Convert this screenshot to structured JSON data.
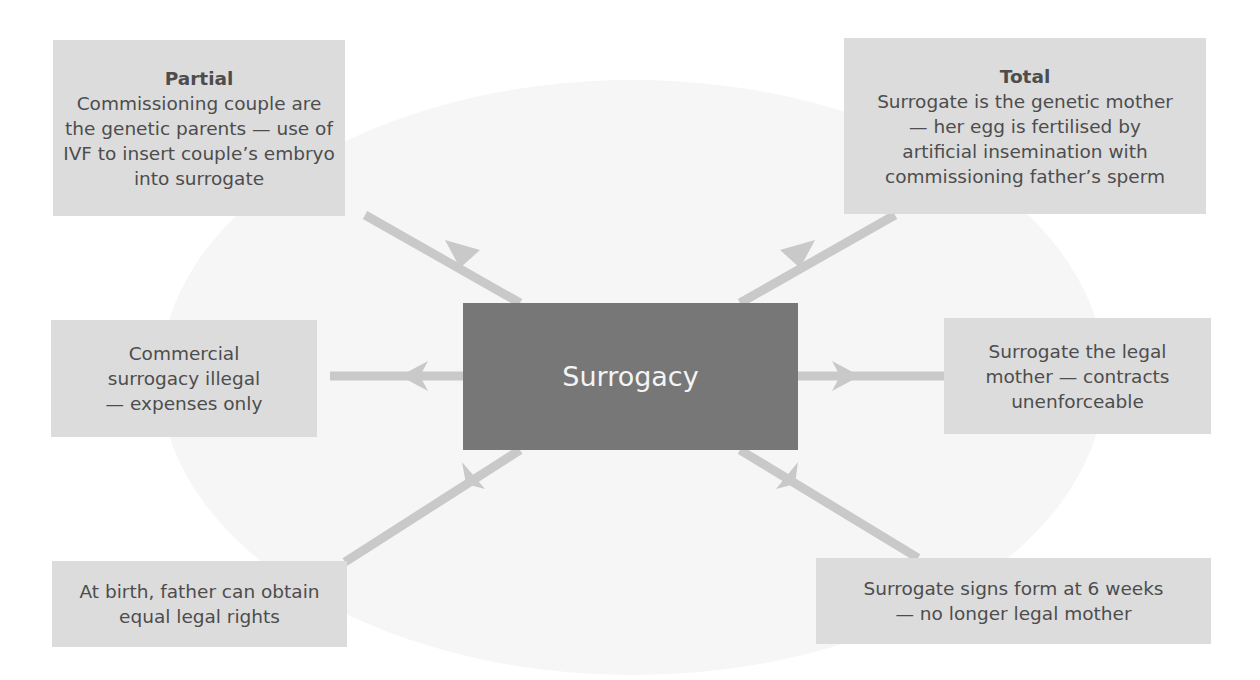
{
  "center": {
    "label": "Surrogacy"
  },
  "nodes": {
    "top_left": {
      "title": "Partial",
      "lines": [
        "Commissioning couple are",
        "the genetic parents — use of",
        "IVF to insert couple’s embryo",
        "into surrogate"
      ]
    },
    "top_right": {
      "title": "Total",
      "lines": [
        "Surrogate is the genetic mother",
        "— her egg is fertilised by",
        "artificial insemination with",
        "commissioning father’s sperm"
      ]
    },
    "mid_left": {
      "lines": [
        "Commercial",
        "surrogacy illegal",
        "— expenses only"
      ]
    },
    "mid_right": {
      "lines": [
        "Surrogate the legal",
        "mother — contracts",
        "unenforceable"
      ]
    },
    "bottom_left": {
      "lines": [
        "At birth, father can obtain",
        "equal legal rights"
      ]
    },
    "bottom_right": {
      "lines": [
        "Surrogate signs form at 6 weeks",
        "— no longer legal mother"
      ]
    }
  },
  "colors": {
    "center_fill": "#777777",
    "box_fill": "#dcdcdc",
    "arrow": "#c9c9c9",
    "background_ellipse": "#f6f6f6"
  }
}
